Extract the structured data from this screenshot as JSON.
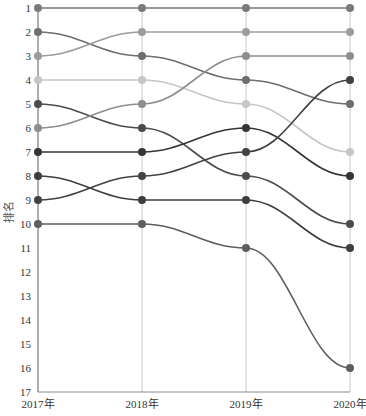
{
  "chart_data": {
    "type": "line",
    "subtype": "bump",
    "title": "",
    "xlabel": "",
    "ylabel": "排名",
    "categories": [
      "2017年",
      "2018年",
      "2019年",
      "2020年"
    ],
    "y_ticks": [
      1,
      2,
      3,
      4,
      5,
      6,
      7,
      8,
      9,
      10,
      11,
      12,
      13,
      14,
      15,
      16,
      17
    ],
    "ylim": [
      1,
      17
    ],
    "y_inverted": true,
    "grid": {
      "x": true,
      "y": false
    },
    "legend": null,
    "series": [
      {
        "name": "A",
        "values": [
          1,
          1,
          1,
          1
        ],
        "color": "#7a7a7a"
      },
      {
        "name": "B",
        "values": [
          2,
          3,
          4,
          5
        ],
        "color": "#6e6e6e"
      },
      {
        "name": "C",
        "values": [
          3,
          2,
          2,
          2
        ],
        "color": "#9c9c9c"
      },
      {
        "name": "D",
        "values": [
          4,
          4,
          5,
          7
        ],
        "color": "#c6c6c6"
      },
      {
        "name": "E",
        "values": [
          5,
          6,
          8,
          10
        ],
        "color": "#4c4c4c"
      },
      {
        "name": "F",
        "values": [
          6,
          5,
          3,
          3
        ],
        "color": "#8e8e8e"
      },
      {
        "name": "G",
        "values": [
          7,
          7,
          6,
          8
        ],
        "color": "#353535"
      },
      {
        "name": "H",
        "values": [
          8,
          9,
          9,
          11
        ],
        "color": "#3e3e3e"
      },
      {
        "name": "I",
        "values": [
          9,
          8,
          7,
          4
        ],
        "color": "#424242"
      },
      {
        "name": "J",
        "values": [
          10,
          10,
          11,
          16
        ],
        "color": "#5e5e5e"
      }
    ]
  }
}
